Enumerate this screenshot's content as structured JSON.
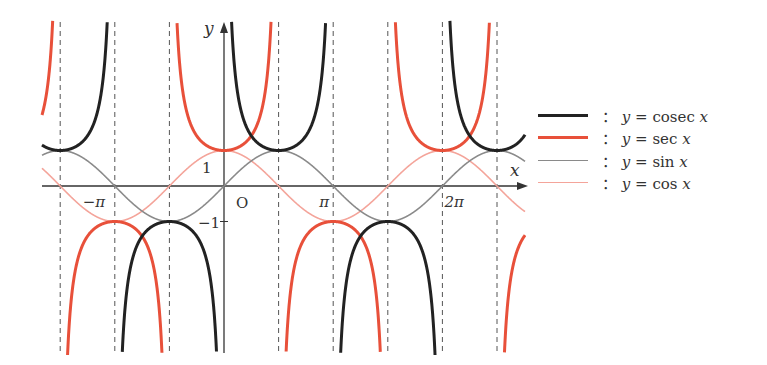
{
  "chart_data": {
    "type": "line",
    "title": "",
    "xlabel": "x",
    "ylabel": "y",
    "origin_label": "O",
    "x_ticks": [
      {
        "value": -3.14159,
        "label": "−π"
      },
      {
        "value": 3.14159,
        "label": "π"
      },
      {
        "value": 6.28319,
        "label": "2π"
      }
    ],
    "y_ticks": [
      {
        "value": 1,
        "label": "1"
      },
      {
        "value": -1,
        "label": "−1"
      }
    ],
    "xlim": [
      -3.3,
      5.3
    ],
    "ylim": [
      -4.7,
      4.6
    ],
    "asymptotes_x": [
      "-3π/2",
      "-π",
      "-π/2",
      "0",
      "π/2",
      "π",
      "3π/2",
      "2π",
      "5π/2"
    ],
    "grid": false,
    "series": [
      {
        "name": "y = cosec x",
        "func": "csc",
        "color": "#222222",
        "width": 3
      },
      {
        "name": "y = sec x",
        "func": "sec",
        "color": "#e8503a",
        "width": 3
      },
      {
        "name": "y = sin x",
        "func": "sin",
        "color": "#8a8a8a",
        "width": 1.6
      },
      {
        "name": "y = cos x",
        "func": "cos",
        "color": "#f4a49a",
        "width": 1.6
      }
    ]
  },
  "legend": {
    "items": [
      {
        "prefix": "：",
        "lhs": "y",
        "eq": " = ",
        "fn": "cosec ",
        "var": "x",
        "color": "#222222",
        "width": 3
      },
      {
        "prefix": "：",
        "lhs": "y",
        "eq": " = ",
        "fn": "sec ",
        "var": "x",
        "color": "#e8503a",
        "width": 3
      },
      {
        "prefix": "：",
        "lhs": "y",
        "eq": " = ",
        "fn": "sin ",
        "var": "x",
        "color": "#8a8a8a",
        "width": 1.6
      },
      {
        "prefix": "：",
        "lhs": "y",
        "eq": " = ",
        "fn": "cos ",
        "var": "x",
        "color": "#f4a49a",
        "width": 1.6
      }
    ]
  }
}
